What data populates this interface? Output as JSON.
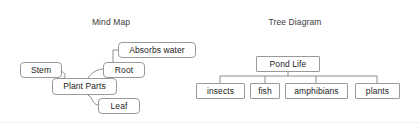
{
  "canvas": {
    "width": 419,
    "height": 123,
    "background": "#ffffff"
  },
  "style": {
    "node_border_color": "#9a9a9a",
    "node_fill_color": "#ffffff",
    "edge_color": "#8c8c8c",
    "text_color": "#1c1c1c",
    "title_color": "#3c3c3c"
  },
  "diagrams": [
    {
      "id": "mind-map",
      "title": "Mind Map",
      "shape": "rounded",
      "root": "Plant Parts",
      "nodes": [
        {
          "id": "stem",
          "label": "Stem",
          "x": 20,
          "y": 62,
          "w": 42,
          "h": 16
        },
        {
          "id": "plant-parts",
          "label": "Plant Parts",
          "x": 52,
          "y": 78,
          "w": 65,
          "h": 17
        },
        {
          "id": "root",
          "label": "Root",
          "x": 103,
          "y": 62,
          "w": 42,
          "h": 16
        },
        {
          "id": "absorbs-water",
          "label": "Absorbs water",
          "x": 118,
          "y": 42,
          "w": 78,
          "h": 16
        },
        {
          "id": "leaf",
          "label": "Leaf",
          "x": 98,
          "y": 98,
          "w": 42,
          "h": 16
        }
      ],
      "edges": [
        {
          "from": "plant-parts",
          "to": "stem",
          "path": "M 63 79 C 70 73, 58 71, 62 70"
        },
        {
          "from": "plant-parts",
          "to": "root",
          "path": "M 88 78 C 92 72, 96 70, 103 69"
        },
        {
          "from": "plant-parts",
          "to": "leaf",
          "path": "M 88 95 C 94 99, 92 104, 98 105"
        },
        {
          "from": "root",
          "to": "absorbs-water",
          "path": "M 113 62 L 113 50 L 118 50"
        }
      ]
    },
    {
      "id": "tree-diagram",
      "title": "Tree Diagram",
      "shape": "square",
      "root": "Pond Life",
      "nodes": [
        {
          "id": "pond-life",
          "label": "Pond Life",
          "x": 256,
          "y": 56,
          "w": 64,
          "h": 16
        },
        {
          "id": "insects",
          "label": "insects",
          "x": 196,
          "y": 83,
          "w": 49,
          "h": 16
        },
        {
          "id": "fish",
          "label": "fish",
          "x": 250,
          "y": 83,
          "w": 30,
          "h": 16
        },
        {
          "id": "amphibians",
          "label": "amphibians",
          "x": 285,
          "y": 83,
          "w": 63,
          "h": 16
        },
        {
          "id": "plants",
          "label": "plants",
          "x": 355,
          "y": 83,
          "w": 45,
          "h": 16
        }
      ],
      "edges": [
        {
          "from": "pond-life",
          "to": "bus",
          "path": "M 288 72 L 288 76"
        },
        {
          "from": "bus",
          "to": "bus",
          "path": "M 220 76 L 377 76"
        },
        {
          "from": "bus",
          "to": "insects",
          "path": "M 220 76 L 220 83"
        },
        {
          "from": "bus",
          "to": "fish",
          "path": "M 265 76 L 265 83"
        },
        {
          "from": "bus",
          "to": "amphibians",
          "path": "M 316 76 L 316 83"
        },
        {
          "from": "bus",
          "to": "plants",
          "path": "M 377 76 L 377 83"
        }
      ]
    }
  ]
}
